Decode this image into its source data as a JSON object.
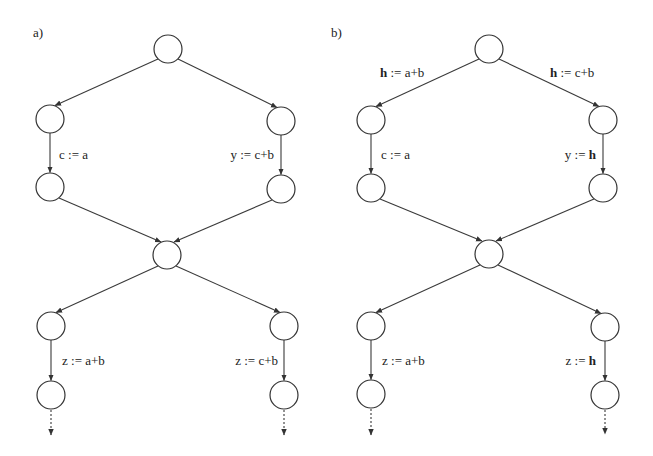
{
  "figure": {
    "panels": [
      {
        "id": "a",
        "label": "a)",
        "label_pos": [
          33,
          37
        ],
        "nodes": [
          {
            "id": "top",
            "cx": 168,
            "cy": 49
          },
          {
            "id": "left1",
            "cx": 50,
            "cy": 119
          },
          {
            "id": "right1",
            "cx": 281,
            "cy": 121
          },
          {
            "id": "left2",
            "cx": 50,
            "cy": 187
          },
          {
            "id": "right2",
            "cx": 281,
            "cy": 189
          },
          {
            "id": "mid",
            "cx": 167,
            "cy": 255
          },
          {
            "id": "left3",
            "cx": 51,
            "cy": 326
          },
          {
            "id": "right3",
            "cx": 284,
            "cy": 326
          },
          {
            "id": "left4",
            "cx": 51,
            "cy": 395
          },
          {
            "id": "right4",
            "cx": 284,
            "cy": 395
          }
        ],
        "edges": [
          {
            "from": "top",
            "to": "left1",
            "label": ""
          },
          {
            "from": "top",
            "to": "right1",
            "label": ""
          },
          {
            "from": "left1",
            "to": "left2",
            "label": "c := a"
          },
          {
            "from": "right1",
            "to": "right2",
            "label": "y := c+b"
          },
          {
            "from": "left2",
            "to": "mid",
            "label": ""
          },
          {
            "from": "right2",
            "to": "mid",
            "label": ""
          },
          {
            "from": "mid",
            "to": "left3",
            "label": ""
          },
          {
            "from": "mid",
            "to": "right3",
            "label": ""
          },
          {
            "from": "left3",
            "to": "left4",
            "label": "z := a+b"
          },
          {
            "from": "right3",
            "to": "right4",
            "label": "z := c+b"
          }
        ],
        "texts": {
          "left_assign_1": "c := a",
          "right_assign_1_var": "y",
          "right_assign_1_op": " := ",
          "right_assign_1_expr": "c+b",
          "left_assign_2": "z := a+b",
          "right_assign_2_var": "z",
          "right_assign_2_op": " := ",
          "right_assign_2_expr": "c+b"
        }
      },
      {
        "id": "b",
        "label": "b)",
        "label_pos": [
          333,
          37
        ],
        "nodes": [
          {
            "id": "top",
            "cx": 489,
            "cy": 49
          },
          {
            "id": "left1",
            "cx": 371,
            "cy": 120
          },
          {
            "id": "right1",
            "cx": 603,
            "cy": 120
          },
          {
            "id": "left2",
            "cx": 371,
            "cy": 188
          },
          {
            "id": "right2",
            "cx": 603,
            "cy": 188
          },
          {
            "id": "mid",
            "cx": 489,
            "cy": 254
          },
          {
            "id": "left3",
            "cx": 371,
            "cy": 326
          },
          {
            "id": "right3",
            "cx": 605,
            "cy": 327
          },
          {
            "id": "left4",
            "cx": 371,
            "cy": 394
          },
          {
            "id": "right4",
            "cx": 605,
            "cy": 395
          }
        ],
        "edges": [
          {
            "from": "top",
            "to": "left1",
            "label": "h := a+b"
          },
          {
            "from": "top",
            "to": "right1",
            "label": "h := c+b"
          },
          {
            "from": "left1",
            "to": "left2",
            "label": "c := a"
          },
          {
            "from": "right1",
            "to": "right2",
            "label": "y := h"
          },
          {
            "from": "left2",
            "to": "mid",
            "label": ""
          },
          {
            "from": "right2",
            "to": "mid",
            "label": ""
          },
          {
            "from": "mid",
            "to": "left3",
            "label": ""
          },
          {
            "from": "mid",
            "to": "right3",
            "label": ""
          },
          {
            "from": "left3",
            "to": "left4",
            "label": "z := a+b"
          },
          {
            "from": "right3",
            "to": "right4",
            "label": "z := h"
          }
        ],
        "texts": {
          "top_left_var": "h",
          "top_left_rest": " := a+b",
          "top_right_var": "h",
          "top_right_rest": " := c+b",
          "left_assign_1": "c := a",
          "right_assign_1_var": "y",
          "right_assign_1_op": " := ",
          "right_assign_1_expr": "h",
          "left_assign_2": "z := a+b",
          "right_assign_2_var": "z",
          "right_assign_2_op": " := ",
          "right_assign_2_expr": "h"
        }
      }
    ],
    "node_radius": 14,
    "colors": {
      "stroke": "#333333",
      "text": "#222222",
      "background": "#ffffff"
    }
  }
}
